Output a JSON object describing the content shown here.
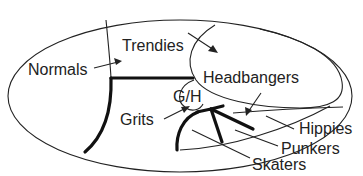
{
  "diagram": {
    "type": "venn-like region map",
    "labels": {
      "normals": "Normals",
      "trendies": "Trendies",
      "headbangers": "Headbangers",
      "gh": "G/H",
      "grits": "Grits",
      "hippies": "Hippies",
      "punkers": "Punkers",
      "skaters": "Skaters"
    },
    "colors": {
      "line": "#222222",
      "background": "#ffffff"
    }
  }
}
